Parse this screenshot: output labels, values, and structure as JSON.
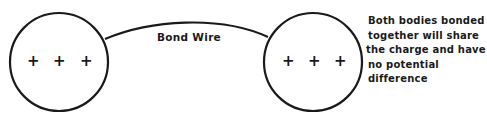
{
  "diagram": {
    "wire_label": "Bond Wire",
    "left_body": {
      "charges": [
        "+",
        "+",
        "+"
      ]
    },
    "right_body": {
      "charges": [
        "+",
        "+",
        "+"
      ]
    },
    "note_lines": [
      "Both bodies bonded",
      "together will share",
      "the charge and have",
      "no potential",
      "difference"
    ]
  }
}
